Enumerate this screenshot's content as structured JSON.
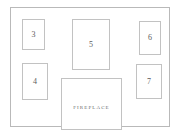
{
  "diagram": {
    "type": "floor-plan",
    "title": "",
    "canvas": {
      "width": 180,
      "height": 137
    },
    "colors": {
      "background": "#ffffff",
      "wall_stroke": "#b9b9b9",
      "unit_stroke": "#c2c2c2",
      "label_text": "#5c5c5c",
      "fireplace_text": "#6b6b6b"
    },
    "room": {
      "name": "room-outline",
      "x": 10,
      "y": 7,
      "width": 160,
      "height": 120
    },
    "units": [
      {
        "id": "unit-3",
        "label": "3",
        "x": 22,
        "y": 19,
        "width": 23,
        "height": 31
      },
      {
        "id": "unit-4",
        "label": "4",
        "x": 22,
        "y": 63,
        "width": 26,
        "height": 37
      },
      {
        "id": "unit-5",
        "label": "5",
        "x": 72,
        "y": 19,
        "width": 38,
        "height": 51
      },
      {
        "id": "unit-6",
        "label": "6",
        "x": 139,
        "y": 21,
        "width": 22,
        "height": 34
      },
      {
        "id": "unit-7",
        "label": "7",
        "x": 136,
        "y": 64,
        "width": 26,
        "height": 35
      }
    ],
    "fireplace": {
      "id": "fireplace",
      "label": "FIREPLACE",
      "x": 61,
      "y": 78,
      "width": 61,
      "height": 52
    }
  }
}
